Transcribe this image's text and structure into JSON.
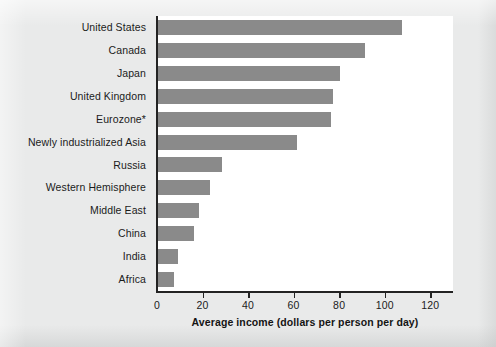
{
  "chart_data": {
    "type": "bar",
    "orientation": "horizontal",
    "title": "",
    "subtitle": "",
    "xlabel": "Average income (dollars per person per day)",
    "ylabel": "",
    "xlim": [
      0,
      130
    ],
    "xticks": [
      0,
      20,
      40,
      60,
      80,
      100,
      120
    ],
    "xtick_labels": [
      "0",
      "20",
      "40",
      "60",
      "80",
      "100",
      "120"
    ],
    "grid": false,
    "legend": null,
    "bar_color": "#8a8a8a",
    "plot_background": "#ffffff",
    "page_background": "#e9eaea",
    "axis_color": "#232323",
    "categories": [
      "United States",
      "Canada",
      "Japan",
      "United Kingdom",
      "Eurozone*",
      "Newly industrialized Asia",
      "Russia",
      "Western Hemisphere",
      "Middle East",
      "China",
      "India",
      "Africa"
    ],
    "values": [
      107,
      91,
      80,
      77,
      76,
      61,
      28,
      23,
      18,
      16,
      9,
      7
    ],
    "annotations": [
      "Eurozone label carries an asterisk footnote marker"
    ]
  }
}
